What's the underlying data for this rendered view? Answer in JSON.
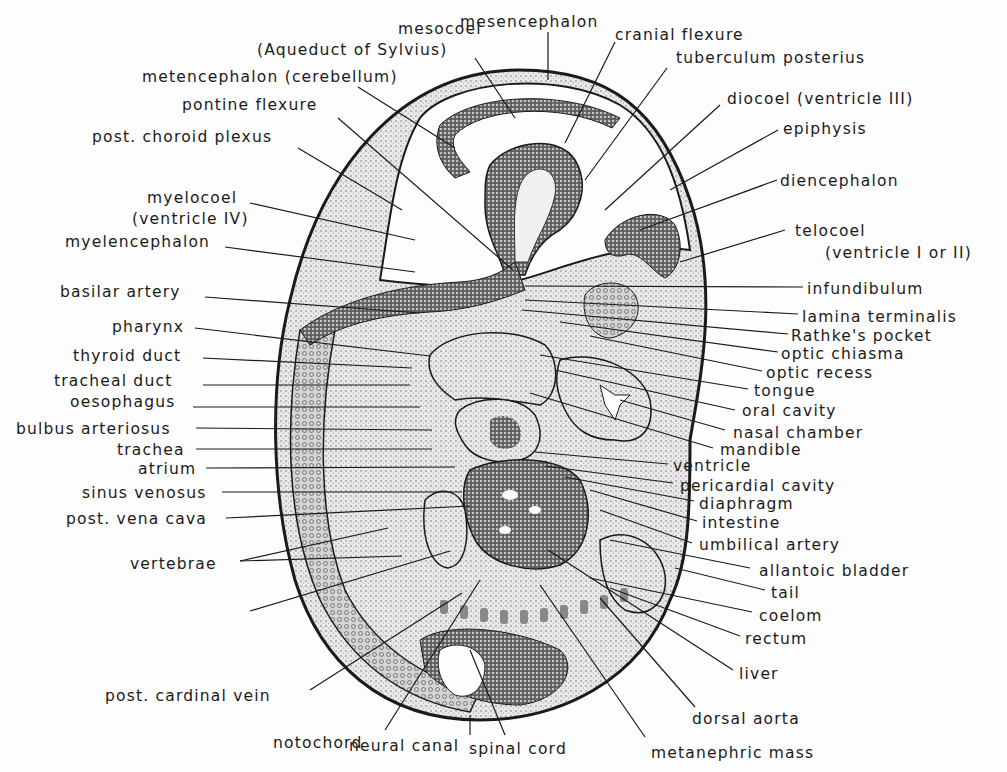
{
  "figure": {
    "type": "labeled anatomical line drawing",
    "colors": {
      "ink": "#1a1a1a",
      "tissue_light": "#d9d9d9",
      "tissue_dark": "#5a5a5a",
      "background": "#fdfdfd"
    }
  },
  "labels": {
    "top": [
      {
        "id": "mesocoel",
        "text": "mesocoel",
        "x": 398,
        "y": 20
      },
      {
        "id": "aqueduct",
        "text": "(Aqueduct of Sylvius)",
        "x": 257,
        "y": 41
      },
      {
        "id": "mesencephalon",
        "text": "mesencephalon",
        "x": 460,
        "y": 13
      },
      {
        "id": "cranial_flexure",
        "text": "cranial flexure",
        "x": 615,
        "y": 26
      },
      {
        "id": "tuberculum_posterius",
        "text": "tuberculum posterius",
        "x": 676,
        "y": 49
      },
      {
        "id": "metencephalon",
        "text": "metencephalon (cerebellum)",
        "x": 142,
        "y": 68
      },
      {
        "id": "pontine_flexure",
        "text": "pontine flexure",
        "x": 182,
        "y": 96
      }
    ],
    "left": [
      {
        "id": "post_choroid_plexus",
        "text": "post. choroid plexus",
        "x": 92,
        "y": 128
      },
      {
        "id": "myelocoel",
        "text": "myelocoel",
        "x": 147,
        "y": 189
      },
      {
        "id": "ventricle_iv",
        "text": "(ventricle IV)",
        "x": 132,
        "y": 210
      },
      {
        "id": "myelencephalon",
        "text": "myelencephalon",
        "x": 65,
        "y": 233
      },
      {
        "id": "basilar_artery",
        "text": "basilar artery",
        "x": 60,
        "y": 283
      },
      {
        "id": "pharynx",
        "text": "pharynx",
        "x": 112,
        "y": 318
      },
      {
        "id": "thyroid_duct",
        "text": "thyroid duct",
        "x": 73,
        "y": 347
      },
      {
        "id": "tracheal_duct",
        "text": "tracheal duct",
        "x": 54,
        "y": 372
      },
      {
        "id": "oesophagus",
        "text": "oesophagus",
        "x": 70,
        "y": 393
      },
      {
        "id": "bulbus_arteriosus",
        "text": "bulbus arteriosus",
        "x": 16,
        "y": 420
      },
      {
        "id": "trachea",
        "text": "trachea",
        "x": 117,
        "y": 441
      },
      {
        "id": "atrium",
        "text": "atrium",
        "x": 138,
        "y": 460
      },
      {
        "id": "sinus_venosus",
        "text": "sinus venosus",
        "x": 82,
        "y": 484
      },
      {
        "id": "post_vena_cava",
        "text": "post. vena cava",
        "x": 66,
        "y": 510
      },
      {
        "id": "vertebrae",
        "text": "vertebrae",
        "x": 130,
        "y": 555
      },
      {
        "id": "post_cardinal_vein",
        "text": "post. cardinal vein",
        "x": 105,
        "y": 687
      }
    ],
    "right": [
      {
        "id": "diocoel",
        "text": "diocoel (ventricle III)",
        "x": 727,
        "y": 90
      },
      {
        "id": "epiphysis",
        "text": "epiphysis",
        "x": 783,
        "y": 120
      },
      {
        "id": "diencephalon",
        "text": "diencephalon",
        "x": 780,
        "y": 172
      },
      {
        "id": "telocoel",
        "text": "telocoel",
        "x": 795,
        "y": 222
      },
      {
        "id": "ventricle_i_or_ii",
        "text": "(ventricle I or II)",
        "x": 825,
        "y": 244
      },
      {
        "id": "infundibulum",
        "text": "infundibulum",
        "x": 807,
        "y": 280
      },
      {
        "id": "lamina_terminalis",
        "text": "lamina terminalis",
        "x": 802,
        "y": 308
      },
      {
        "id": "rathkes_pocket",
        "text": "Rathke's pocket",
        "x": 791,
        "y": 327
      },
      {
        "id": "optic_chiasma",
        "text": "optic chiasma",
        "x": 781,
        "y": 345
      },
      {
        "id": "optic_recess",
        "text": "optic recess",
        "x": 766,
        "y": 364
      },
      {
        "id": "tongue",
        "text": "tongue",
        "x": 754,
        "y": 382
      },
      {
        "id": "oral_cavity",
        "text": "oral cavity",
        "x": 742,
        "y": 402
      },
      {
        "id": "nasal_chamber",
        "text": "nasal chamber",
        "x": 733,
        "y": 424
      },
      {
        "id": "mandible",
        "text": "mandible",
        "x": 720,
        "y": 441
      },
      {
        "id": "ventricle",
        "text": "ventricle",
        "x": 673,
        "y": 457
      },
      {
        "id": "pericardial_cavity",
        "text": "pericardial cavity",
        "x": 680,
        "y": 477
      },
      {
        "id": "diaphragm",
        "text": "diaphragm",
        "x": 699,
        "y": 495
      },
      {
        "id": "intestine",
        "text": "intestine",
        "x": 702,
        "y": 514
      },
      {
        "id": "umbilical_artery",
        "text": "umbilical artery",
        "x": 699,
        "y": 536
      },
      {
        "id": "allantoic_bladder",
        "text": "allantoic bladder",
        "x": 759,
        "y": 562
      },
      {
        "id": "tail",
        "text": "tail",
        "x": 771,
        "y": 584
      },
      {
        "id": "coelom",
        "text": "coelom",
        "x": 759,
        "y": 607
      },
      {
        "id": "rectum",
        "text": "rectum",
        "x": 745,
        "y": 630
      },
      {
        "id": "liver",
        "text": "liver",
        "x": 739,
        "y": 665
      }
    ],
    "bottom": [
      {
        "id": "dorsal_aorta",
        "text": "dorsal aorta",
        "x": 692,
        "y": 710
      },
      {
        "id": "notochord",
        "text": "notochord",
        "x": 273,
        "y": 734
      },
      {
        "id": "neural_canal",
        "text": "neural canal",
        "x": 349,
        "y": 737
      },
      {
        "id": "spinal_cord",
        "text": "spinal cord",
        "x": 469,
        "y": 740
      },
      {
        "id": "metanephric_mass",
        "text": "metanephric mass",
        "x": 651,
        "y": 744
      }
    ]
  },
  "leaders": [
    [
      "aqueduct",
      475,
      58,
      515,
      118
    ],
    [
      "mesencephalon",
      548,
      32,
      548,
      80
    ],
    [
      "cranial_flexure",
      615,
      42,
      565,
      143
    ],
    [
      "tuberculum_posterius",
      667,
      68,
      585,
      180
    ],
    [
      "metencephalon",
      358,
      87,
      455,
      148
    ],
    [
      "pontine_flexure",
      338,
      118,
      513,
      270
    ],
    [
      "post_choroid_plexus",
      298,
      148,
      402,
      210
    ],
    [
      "myelocoel",
      250,
      203,
      415,
      240
    ],
    [
      "myelencephalon",
      225,
      247,
      415,
      272
    ],
    [
      "basilar_artery",
      205,
      297,
      420,
      313
    ],
    [
      "pharynx",
      195,
      328,
      430,
      356
    ],
    [
      "thyroid_duct",
      203,
      358,
      412,
      368
    ],
    [
      "tracheal_duct",
      203,
      385,
      410,
      385
    ],
    [
      "oesophagus",
      193,
      407,
      420,
      407
    ],
    [
      "bulbus_arteriosus",
      196,
      428,
      432,
      430
    ],
    [
      "trachea",
      196,
      449,
      432,
      449
    ],
    [
      "atrium",
      206,
      468,
      455,
      467
    ],
    [
      "sinus_venosus",
      222,
      492,
      462,
      492
    ],
    [
      "post_vena_cava",
      226,
      518,
      470,
      506
    ],
    [
      "vertebrae",
      240,
      561,
      388,
      528
    ],
    [
      "vertebrae",
      240,
      561,
      402,
      556
    ],
    [
      "vertebrae_lower",
      250,
      611,
      450,
      551
    ],
    [
      "diocoel",
      720,
      105,
      605,
      210
    ],
    [
      "epiphysis",
      778,
      130,
      670,
      190
    ],
    [
      "diencephalon",
      777,
      180,
      640,
      230
    ],
    [
      "telocoel",
      785,
      230,
      680,
      262
    ],
    [
      "infundibulum",
      803,
      287,
      525,
      286
    ],
    [
      "lamina_terminalis",
      798,
      314,
      525,
      300
    ],
    [
      "rathkes_pocket",
      788,
      334,
      522,
      310
    ],
    [
      "optic_chiasma",
      778,
      352,
      560,
      322
    ],
    [
      "optic_recess",
      762,
      371,
      590,
      336
    ],
    [
      "tongue",
      748,
      389,
      540,
      355
    ],
    [
      "oral_cavity",
      735,
      410,
      555,
      370
    ],
    [
      "nasal_chamber",
      725,
      430,
      620,
      400
    ],
    [
      "mandible",
      713,
      448,
      530,
      393
    ],
    [
      "ventricle",
      668,
      464,
      535,
      452
    ],
    [
      "pericardial_cavity",
      673,
      483,
      545,
      466
    ],
    [
      "diaphragm",
      694,
      501,
      565,
      477
    ],
    [
      "intestine",
      697,
      521,
      590,
      490
    ],
    [
      "umbilical_artery",
      692,
      543,
      600,
      510
    ],
    [
      "allantoic_bladder",
      750,
      568,
      610,
      540
    ],
    [
      "tail",
      765,
      590,
      675,
      568
    ],
    [
      "coelom",
      752,
      612,
      590,
      578
    ],
    [
      "rectum",
      740,
      636,
      610,
      588
    ],
    [
      "liver",
      733,
      670,
      548,
      550
    ],
    [
      "dorsal_aorta",
      695,
      707,
      600,
      598
    ],
    [
      "metanephric_mass",
      645,
      737,
      540,
      585
    ],
    [
      "spinal_cord",
      505,
      735,
      470,
      650
    ],
    [
      "neural_canal",
      470,
      735,
      470,
      715
    ],
    [
      "notochord",
      385,
      730,
      480,
      580
    ],
    [
      "post_cardinal_vein",
      310,
      690,
      462,
      593
    ]
  ]
}
